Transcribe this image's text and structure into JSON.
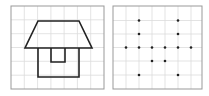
{
  "panels": [
    {
      "name": "house-figure",
      "grid": {
        "cols": 7,
        "rows": 6
      },
      "shape": "house outline: trapezoid roof, rectangular body, small door"
    },
    {
      "name": "dot-pattern",
      "grid": {
        "cols": 7,
        "rows": 6
      },
      "dots": [
        [
          1,
          1
        ],
        [
          5,
          1
        ],
        [
          1,
          2
        ],
        [
          5,
          2
        ],
        [
          0,
          3
        ],
        [
          1,
          3
        ],
        [
          2,
          3
        ],
        [
          3,
          3
        ],
        [
          4,
          3
        ],
        [
          5,
          3
        ],
        [
          6,
          3
        ],
        [
          2,
          4
        ],
        [
          3,
          4
        ],
        [
          1,
          5
        ],
        [
          5,
          5
        ]
      ]
    }
  ],
  "colors": {
    "grid": "#dcdcdc",
    "border": "#999999",
    "stroke": "#222222"
  }
}
